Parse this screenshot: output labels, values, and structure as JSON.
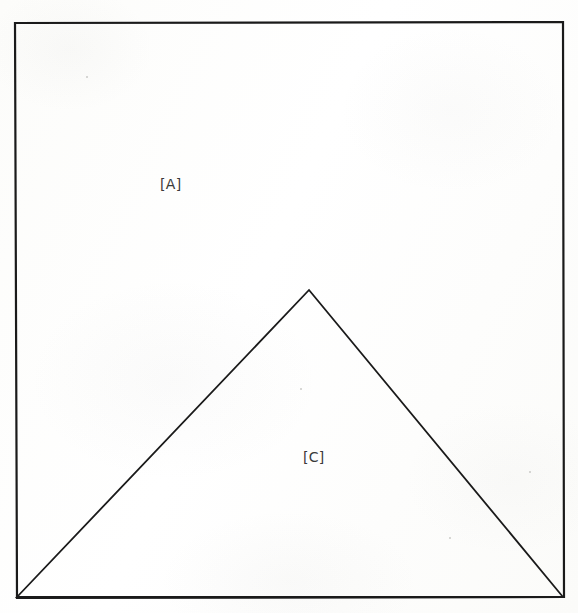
{
  "figure": {
    "background_color": "#fdfdfc",
    "ink_color": "#1a1a1a",
    "width": 578,
    "height": 613,
    "outer_shape": {
      "name": "rectangle",
      "stroke_color": "#1a1a1a",
      "stroke_width": 2.2,
      "fill": "none",
      "corners": [
        {
          "label": "top-left",
          "x": 15,
          "y": 23
        },
        {
          "label": "top-right",
          "x": 563,
          "y": 22
        },
        {
          "label": "bottom-right",
          "x": 564,
          "y": 597
        },
        {
          "label": "bottom-left",
          "x": 17,
          "y": 598
        }
      ]
    },
    "inner_shape": {
      "name": "triangle",
      "stroke_color": "#1a1a1a",
      "stroke_width": 1.8,
      "fill": "none",
      "vertices": [
        {
          "label": "apex",
          "x": 309,
          "y": 290
        },
        {
          "label": "base-left",
          "x": 17,
          "y": 597
        },
        {
          "label": "base-right",
          "x": 563,
          "y": 597
        }
      ]
    },
    "labels": [
      {
        "id": "A",
        "text": "[A]",
        "region": "rectangle-upper-area",
        "x": 172,
        "y": 185
      },
      {
        "id": "C",
        "text": "[C]",
        "region": "triangle-interior",
        "x": 316,
        "y": 458
      }
    ],
    "specks": [
      {
        "x": 86,
        "y": 76,
        "size": 2
      },
      {
        "x": 300,
        "y": 388,
        "size": 2
      },
      {
        "x": 529,
        "y": 471,
        "size": 2
      },
      {
        "x": 449,
        "y": 537,
        "size": 2
      }
    ]
  }
}
